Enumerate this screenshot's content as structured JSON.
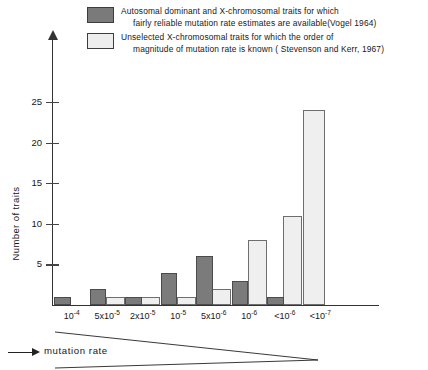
{
  "legend": {
    "entries": [
      {
        "swatch": "dark",
        "color": "#7a7a7a",
        "line1": "Autosomal dominant and X-chromosomal traits for which",
        "line2": "fairly reliable mutation rate estimates are available(Vogel 1964)"
      },
      {
        "swatch": "light",
        "color": "#ededed",
        "line1": "Unselected X-chromosomal traits for which the order of",
        "line2": "magnitude of mutation rate is known ( Stevenson and Kerr, 1967)"
      }
    ]
  },
  "axes": {
    "ylabel": "Number of traits",
    "xlabel": "mutation rate",
    "yticks": [
      5,
      10,
      15,
      20,
      25
    ],
    "ytick_labels": [
      "5",
      "10",
      "15",
      "20",
      "25"
    ]
  },
  "chart_data": {
    "type": "bar",
    "title": "",
    "xlabel": "mutation rate",
    "ylabel": "Number of traits",
    "ylim": [
      0,
      27
    ],
    "grid": false,
    "legend_position": "top",
    "categories": [
      "10⁻⁴",
      "5x10⁻⁵",
      "2x10⁻⁵",
      "10⁻⁵",
      "5x10⁻⁶",
      "10⁻⁶",
      "<10⁻⁶",
      "<10⁻⁷"
    ],
    "categories_html": [
      {
        "base": "10",
        "exp": "-4",
        "prefix": ""
      },
      {
        "base": "10",
        "exp": "-5",
        "prefix": "5x"
      },
      {
        "base": "10",
        "exp": "-5",
        "prefix": "2x"
      },
      {
        "base": "10",
        "exp": "-5",
        "prefix": ""
      },
      {
        "base": "10",
        "exp": "-6",
        "prefix": "5x"
      },
      {
        "base": "10",
        "exp": "-6",
        "prefix": ""
      },
      {
        "base": "10",
        "exp": "-6",
        "prefix": "<"
      },
      {
        "base": "10",
        "exp": "-7",
        "prefix": "<"
      }
    ],
    "series": [
      {
        "name": "Autosomal dominant and X-chromosomal traits for which fairly reliable mutation rate estimates are available(Vogel 1964)",
        "short_name": "Vogel 1964",
        "color": "#7a7a7a",
        "values": [
          1,
          2,
          1,
          4,
          6,
          3,
          1,
          0
        ]
      },
      {
        "name": "Unselected X-chromosomal traits for which the order of magnitude of mutation rate is known ( Stevenson and Kerr, 1967)",
        "short_name": "Stevenson and Kerr, 1967",
        "color": "#ededed",
        "values": [
          0,
          1,
          1,
          1,
          2,
          8,
          11,
          24
        ]
      }
    ]
  }
}
